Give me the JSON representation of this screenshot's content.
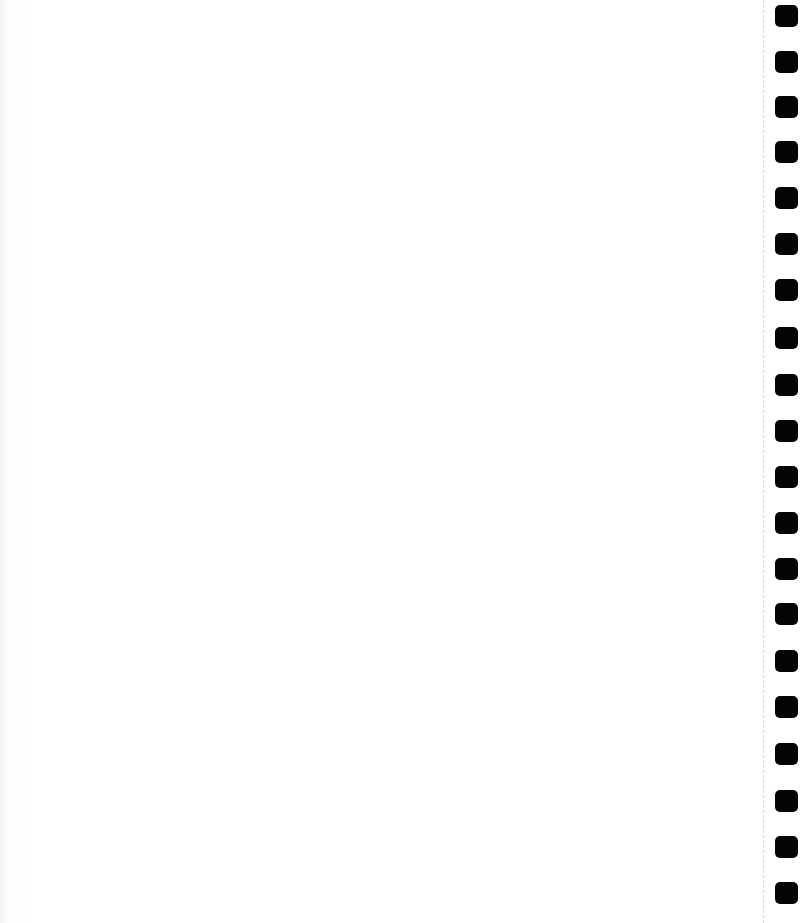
{
  "notebook_page": {
    "content": "",
    "background_color": "#ffffff",
    "binding": {
      "side": "right",
      "hole_color": "#050505",
      "hole_count": 20,
      "hole_positions_y": [
        16,
        62,
        107,
        152,
        198,
        244,
        290,
        338,
        385,
        431,
        477,
        523,
        569,
        614,
        661,
        707,
        754,
        801,
        847,
        893
      ]
    }
  }
}
